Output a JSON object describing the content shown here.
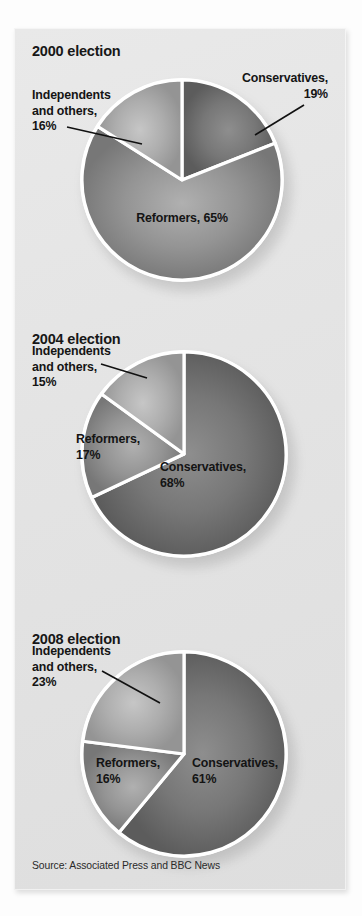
{
  "figure": {
    "background_color": "#fdfdfd",
    "panel_color": "#e6e6e6",
    "source": "Source: Associated Press and BBC News"
  },
  "palette": {
    "conservatives": "#6e6e6e",
    "reformers": "#8a8a8a",
    "independents": "#a6a6a6",
    "divider": "#ffffff",
    "text": "#141414"
  },
  "chart_data": [
    {
      "type": "pie",
      "title": "2000 election",
      "categories": [
        "Conservatives",
        "Reformers",
        "Independents and others"
      ],
      "values": [
        19,
        65,
        16
      ],
      "unit": "%",
      "start_angle": 0,
      "direction": "clockwise",
      "labels": [
        {
          "key": "conservatives",
          "text": "Conservatives,\n19%",
          "name": "Conservatives",
          "value": 19
        },
        {
          "key": "reformers",
          "text": "Reformers, 65%",
          "name": "Reformers",
          "value": 65
        },
        {
          "key": "independents",
          "text": "Independents\nand others,\n16%",
          "name": "Independents and others",
          "value": 16
        }
      ]
    },
    {
      "type": "pie",
      "title": "2004 election",
      "categories": [
        "Conservatives",
        "Reformers",
        "Independents and others"
      ],
      "values": [
        68,
        17,
        15
      ],
      "unit": "%",
      "start_angle": 0,
      "direction": "clockwise",
      "labels": [
        {
          "key": "conservatives",
          "text": "Conservatives,\n68%",
          "name": "Conservatives",
          "value": 68
        },
        {
          "key": "reformers",
          "text": "Reformers,\n17%",
          "name": "Reformers",
          "value": 17
        },
        {
          "key": "independents",
          "text": "Independents\nand others,\n15%",
          "name": "Independents and others",
          "value": 15
        }
      ]
    },
    {
      "type": "pie",
      "title": "2008 election",
      "categories": [
        "Conservatives",
        "Reformers",
        "Independents and others"
      ],
      "values": [
        61,
        16,
        23
      ],
      "unit": "%",
      "start_angle": 0,
      "direction": "clockwise",
      "labels": [
        {
          "key": "conservatives",
          "text": "Conservatives,\n61%",
          "name": "Conservatives",
          "value": 61
        },
        {
          "key": "reformers",
          "text": "Reformers,\n16%",
          "name": "Reformers",
          "value": 16
        },
        {
          "key": "independents",
          "text": "Independents\nand others,\n23%",
          "name": "Independents and others",
          "value": 23
        }
      ]
    }
  ]
}
